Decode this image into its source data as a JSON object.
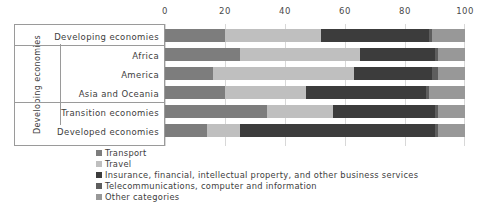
{
  "chart_data": {
    "type": "bar",
    "orientation": "horizontal",
    "stacked": true,
    "stack_mode": "percent",
    "title": "",
    "xlabel": "",
    "ylabel": "",
    "xlim": [
      0,
      100
    ],
    "xticks": [
      0,
      20,
      40,
      60,
      80,
      100
    ],
    "xtick_labels": [
      "0",
      "20",
      "40",
      "60",
      "80",
      "100"
    ],
    "grid": true,
    "legend_position": "bottom-left",
    "categories": [
      "Developing economies",
      "Africa",
      "America",
      "Asia and Oceania",
      "Transition economies",
      "Developed economies"
    ],
    "group_label": "Developing economies",
    "group_members": [
      "Africa",
      "America",
      "Asia and Oceania"
    ],
    "series": [
      {
        "name": "Transport",
        "color": "#7d7d7d",
        "values": [
          20,
          25,
          16,
          20,
          34,
          14
        ]
      },
      {
        "name": "Travel",
        "color": "#bfbfbf",
        "values": [
          32,
          40,
          47,
          27,
          22,
          11
        ]
      },
      {
        "name": "Insurance, financial, intellectual property, and other business services",
        "color": "#3c3c3c",
        "values": [
          36,
          25,
          26,
          40,
          34,
          65
        ]
      },
      {
        "name": "Telecommunications, computer and information",
        "color": "#5e5e5e",
        "values": [
          1,
          1,
          2,
          1,
          1,
          1
        ]
      },
      {
        "name": "Other categories",
        "color": "#989898",
        "values": [
          11,
          9,
          9,
          12,
          9,
          9
        ]
      }
    ]
  },
  "legend": {
    "items": [
      "Transport",
      "Travel",
      "Insurance, financial, intellectual property, and other business services",
      "Telecommunications, computer and information",
      "Other categories"
    ]
  }
}
